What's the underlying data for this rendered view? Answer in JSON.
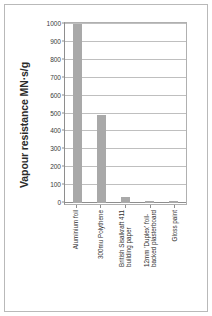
{
  "chart_data": {
    "type": "bar",
    "title": "",
    "xlabel": "",
    "ylabel": "Vapour resistance MN·s/g",
    "ylim": [
      0,
      1000
    ],
    "ytick_step": 100,
    "grid": true,
    "legend": "none",
    "bar_color": "#a9a9a9",
    "frame_color": "#b9b9b9",
    "gridline_color": "#bfbfbf",
    "axis_color": "#8e8e8e",
    "categories": [
      "Aluminium foil",
      "300mu Polythene",
      "British Sisalkraft 411 building paper",
      "12mm 'Duplex' foil-backed plasterboard",
      "Gloss paint"
    ],
    "category_lines": [
      [
        "Aluminium foil"
      ],
      [
        "300mu Polythene"
      ],
      [
        "British Sisalkraft 411",
        "building paper"
      ],
      [
        "12mm 'Duplex' foil-",
        "backed plasterboard"
      ],
      [
        "Gloss paint"
      ]
    ],
    "values": [
      1000,
      490,
      35,
      10,
      10
    ],
    "ytick_labels": [
      "1000",
      "900",
      "800",
      "700",
      "600",
      "500",
      "400",
      "300",
      "200",
      "100",
      "0"
    ],
    "ytick_values": [
      1000,
      900,
      800,
      700,
      600,
      500,
      400,
      300,
      200,
      100,
      0
    ]
  }
}
